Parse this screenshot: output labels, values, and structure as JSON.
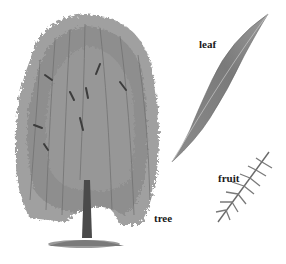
{
  "illustration": {
    "subject": "weeping willow",
    "labels": {
      "tree": "tree",
      "leaf": "leaf",
      "fruit": "fruit"
    },
    "colors": {
      "background": "#ffffff",
      "foliage": "#8a8a8a",
      "foliage_dark": "#555555",
      "trunk": "#3a3a3a",
      "label": "#1a1a1a"
    }
  }
}
